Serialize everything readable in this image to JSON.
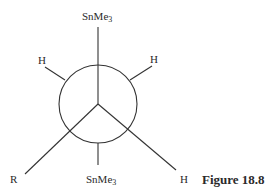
{
  "figure": {
    "caption": "Figure 18.8",
    "type": "Newman projection",
    "front_substituents": {
      "top": {
        "symbol": "SnMe",
        "subscript": "3"
      },
      "bottom_left": {
        "symbol": "R"
      },
      "bottom_right": {
        "symbol": "H"
      }
    },
    "back_substituents": {
      "top_left": {
        "symbol": "H"
      },
      "top_right": {
        "symbol": "H"
      },
      "bottom": {
        "symbol": "SnMe",
        "subscript": "3"
      }
    }
  }
}
